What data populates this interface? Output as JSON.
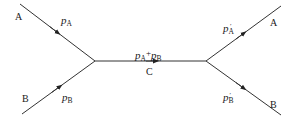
{
  "diagram": {
    "type": "particle-scattering-vertex",
    "nodes": {
      "in_A": "A",
      "in_B": "B",
      "intermediate": "C",
      "out_A": "A",
      "out_B": "B"
    },
    "momenta": {
      "p_A": {
        "base": "p",
        "sub": "A"
      },
      "p_B": {
        "base": "p",
        "sub": "B"
      },
      "sum": {
        "a_base": "p",
        "a_sub": "A",
        "op": "+",
        "b_base": "p",
        "b_sub": "B"
      },
      "p_A_prime": {
        "base": "p",
        "sub": "A",
        "sup": "′"
      },
      "p_B_prime": {
        "base": "p",
        "sub": "B",
        "sup": "′"
      }
    },
    "colors": {
      "line": "#333333",
      "text": "#1a1a1a",
      "background": "#ffffff"
    }
  }
}
